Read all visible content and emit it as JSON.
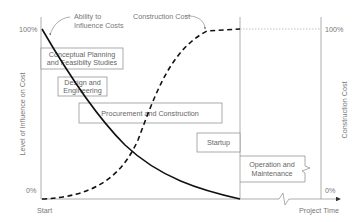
{
  "diagram": {
    "type": "project-lifecycle-influence-vs-cost",
    "left_axis": {
      "label": "Level of Influence on Cost",
      "top_tick": "100%",
      "bottom_tick": "0%"
    },
    "right_axis": {
      "label": "Construction Cost",
      "top_tick": "100%",
      "bottom_tick": "0%"
    },
    "x_axis": {
      "start_label": "Start",
      "end_label": "Project Time"
    },
    "callouts": {
      "influence": {
        "line1": "Ability to",
        "line2": "Influence Costs"
      },
      "cost": "Construction Cost"
    },
    "phases": [
      {
        "line1": "Conceptual Planning",
        "line2": "and Feasibilty Studies"
      },
      {
        "line1": "Design and",
        "line2": "Engineering"
      },
      {
        "line1": "Procurement and Construction",
        "line2": ""
      },
      {
        "line1": "Startup",
        "line2": ""
      },
      {
        "line1": "Operation and",
        "line2": "Maintenance"
      }
    ],
    "series": [
      {
        "name": "Ability to Influence Costs",
        "style": "solid",
        "trend": "decreasing from 100% to 0%"
      },
      {
        "name": "Construction Cost",
        "style": "dashed",
        "trend": "S-curve increasing from 0% to 100%"
      }
    ],
    "colors": {
      "curve": "#111111",
      "axis": "#999999",
      "box_border": "#888888",
      "text": "#777777"
    }
  }
}
